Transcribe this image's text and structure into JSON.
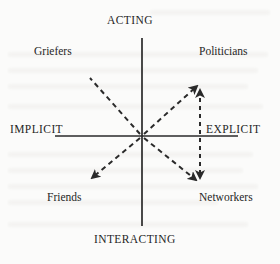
{
  "diagram": {
    "title_visible": false,
    "background_color": "#fbfbfa",
    "line_color": "#2a2a2a",
    "axes": {
      "vertical": {
        "top_label": "ACTING",
        "bottom_label": "INTERACTING",
        "x": 142,
        "y_top": 38,
        "y_bottom": 226
      },
      "horizontal": {
        "left_label": "IMPLICIT",
        "right_label": "EXPLICIT",
        "y": 136,
        "x_left": 55,
        "x_right": 238
      }
    },
    "quadrants": [
      {
        "name": "upper-left",
        "label": "Griefers",
        "x": 34,
        "y": 45
      },
      {
        "name": "upper-right",
        "label": "Politicians",
        "x": 199,
        "y": 45
      },
      {
        "name": "lower-left",
        "label": "Friends",
        "x": 47,
        "y": 191
      },
      {
        "name": "lower-right",
        "label": "Networkers",
        "x": 199,
        "y": 191
      }
    ],
    "arrows": [
      {
        "name": "center-to-upper-left",
        "x1": 142,
        "y1": 136,
        "x2": 90,
        "y2": 78,
        "arrowhead": "none",
        "style": "dashed"
      },
      {
        "name": "center-to-upper-right",
        "x1": 142,
        "y1": 136,
        "x2": 198,
        "y2": 84,
        "arrowhead": "end",
        "style": "dashed"
      },
      {
        "name": "center-to-lower-left",
        "x1": 142,
        "y1": 136,
        "x2": 90,
        "y2": 180,
        "arrowhead": "end",
        "style": "dashed"
      },
      {
        "name": "center-to-lower-right",
        "x1": 142,
        "y1": 136,
        "x2": 198,
        "y2": 182,
        "arrowhead": "end",
        "style": "dashed"
      },
      {
        "name": "vertical-connector",
        "x1": 200,
        "y1": 84,
        "x2": 200,
        "y2": 183,
        "arrowhead": "both",
        "style": "dashed"
      }
    ]
  }
}
